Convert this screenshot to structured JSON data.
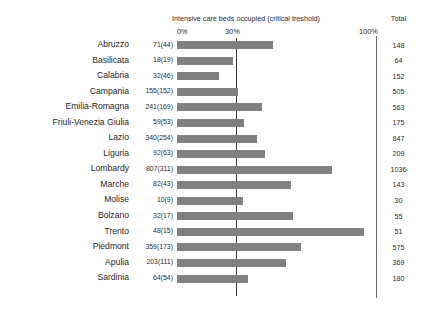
{
  "chart_data": {
    "type": "bar",
    "title": "Intensive care beds occupied (critical treshold)",
    "xlabel": "",
    "ylabel": "",
    "orientation": "horizontal",
    "xlim": [
      0,
      100
    ],
    "xunit": "%",
    "tick_labels": [
      "0%",
      "30%",
      "100%"
    ],
    "tick_values": [
      0,
      30,
      100
    ],
    "grid": false,
    "legend": null,
    "threshold": {
      "value": 30,
      "label": "30%",
      "description": "critical treshold"
    },
    "total_column_header": "Total",
    "value_label_format": "occupied(threshold)",
    "categories": [
      "Abruzzo",
      "Basilicata",
      "Calabria",
      "Campania",
      "Emilia-Romagna",
      "Friuli-Venezia Giulia",
      "Lazio",
      "Liguria",
      "Lombardy",
      "Marche",
      "Molise",
      "Bolzano",
      "Trento",
      "Piedmont",
      "Apulia",
      "Sardinia"
    ],
    "occupied": [
      71,
      18,
      32,
      155,
      241,
      59,
      340,
      92,
      807,
      82,
      10,
      32,
      48,
      359,
      203,
      64
    ],
    "critical": [
      44,
      19,
      46,
      152,
      169,
      53,
      254,
      63,
      311,
      43,
      9,
      17,
      15,
      173,
      111,
      54
    ],
    "totals": [
      148,
      64,
      152,
      505,
      563,
      175,
      847,
      209,
      1036,
      143,
      30,
      55,
      51,
      575,
      369,
      180
    ],
    "values": [
      48.0,
      28.1,
      21.1,
      30.7,
      42.8,
      33.7,
      40.1,
      44.0,
      77.9,
      57.3,
      33.3,
      58.2,
      94.1,
      62.4,
      55.0,
      35.6
    ],
    "value_labels": [
      "71(44)",
      "18(19)",
      "32(46)",
      "155(152)",
      "241(169)",
      "59(53)",
      "340(254)",
      "92(63)",
      "807(311)",
      "82(43)",
      "10(9)",
      "32(17)",
      "48(15)",
      "359(173)",
      "203(111)",
      "64(54)"
    ],
    "total_labels": [
      "148",
      "64",
      "152",
      "505",
      "563",
      "175",
      "847",
      "209",
      "1036",
      "143",
      "30",
      "55",
      "51",
      "575",
      "369",
      "180"
    ],
    "bar_color": "#808080",
    "threshold_line_color": "#3a3a3a",
    "axis_line_color": "#6e6e6e"
  }
}
